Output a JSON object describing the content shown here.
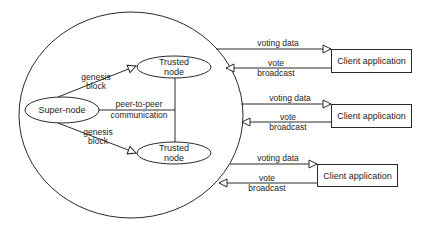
{
  "diagram": {
    "super_node": {
      "label": "Super-node"
    },
    "trusted_nodes": [
      {
        "line1": "Trusted",
        "line2": "node"
      },
      {
        "line1": "Trusted",
        "line2": "node"
      }
    ],
    "edges": {
      "genesis_top": {
        "line1": "genesis",
        "line2": "block"
      },
      "genesis_bottom": {
        "line1": "genesis",
        "line2": "block"
      },
      "peer": {
        "line1": "peer-to-peer",
        "line2": "communication"
      }
    },
    "clients": [
      {
        "label": "Client application",
        "voting_data": "voting data",
        "vote_line1": "vote",
        "vote_line2": "broadcast"
      },
      {
        "label": "Client application",
        "voting_data": "voting data",
        "vote_line1": "vote",
        "vote_line2": "broadcast"
      },
      {
        "label": "Client application",
        "voting_data": "voting data",
        "vote_line1": "vote",
        "vote_line2": "broadcast"
      }
    ],
    "colors": {
      "stroke": "#2a2a2a",
      "text": "#1e1e1e",
      "background": "#ffffff"
    }
  }
}
